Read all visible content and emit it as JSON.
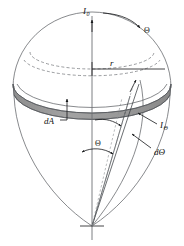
{
  "figure": {
    "background_color": "#ffffff",
    "band_color": "#9a9a9a",
    "band_shadow_color": "#8a8a8a",
    "line_color": "#55585c",
    "label_color": "#111111",
    "labels": {
      "intensity_normal": {
        "text": "I",
        "subscript": "0",
        "name": "I0"
      },
      "zenith_angle_top": {
        "text": "Θ",
        "name": "Theta"
      },
      "radius": {
        "text": "r",
        "name": "r"
      },
      "area_element": {
        "text": "dA",
        "name": "dA"
      },
      "intensity_theta": {
        "text": "I",
        "subscript": "Θ",
        "name": "I-Theta"
      },
      "angle_element": {
        "text": "dΘ",
        "name": "dTheta"
      },
      "zenith_angle_mid": {
        "text": "Θ",
        "name": "Theta-mid"
      }
    },
    "annotations": [
      "I0 vertical arrow at apex along polar axis",
      "Theta curved arrow at upper right of dome",
      "r horizontal radius line from axis to rim",
      "dA leader line pointing up to shaded annular band",
      "I-Theta arrows pointing to inclined ray",
      "dTheta arrow indicating differential angle wedge",
      "Theta double-headed arc between polar axis and inclined ray"
    ]
  }
}
